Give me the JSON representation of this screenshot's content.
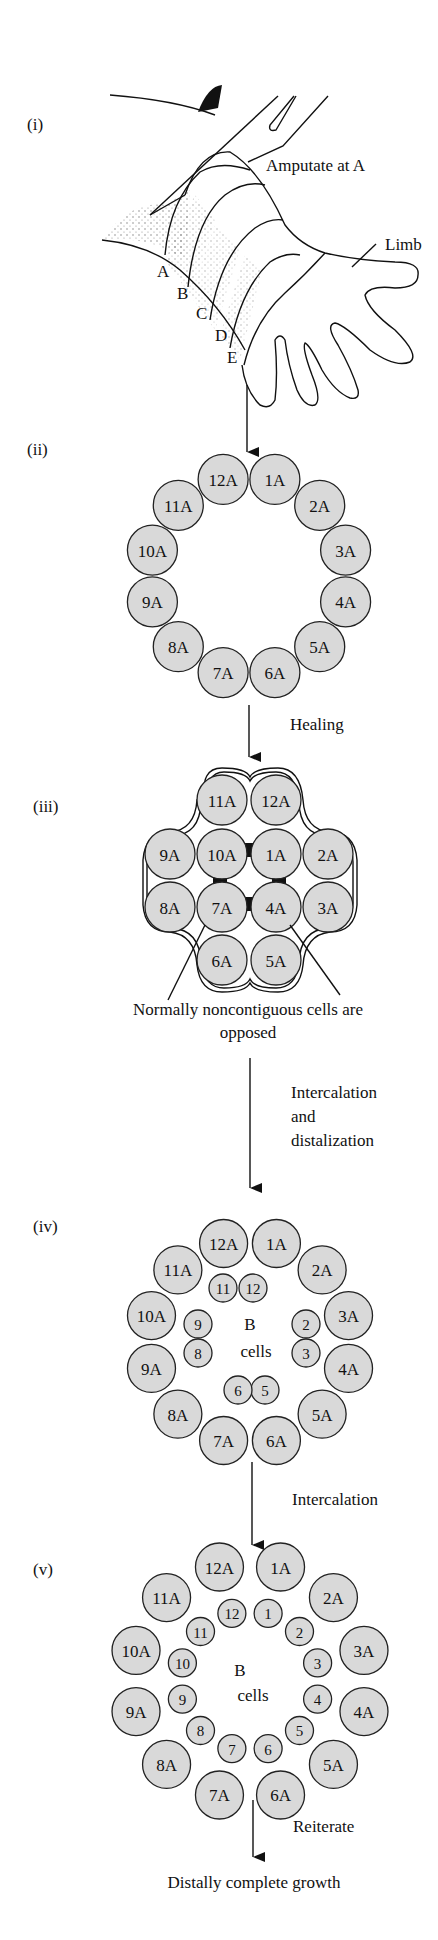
{
  "figure": {
    "stages": [
      {
        "id": "i",
        "label": "(i)"
      },
      {
        "id": "ii",
        "label": "(ii)"
      },
      {
        "id": "iii",
        "label": "(iii)"
      },
      {
        "id": "iv",
        "label": "(iv)"
      },
      {
        "id": "v",
        "label": "(v)"
      }
    ],
    "limb": {
      "amputate_label": "Amputate at A",
      "limb_label": "Limb",
      "levels": [
        "A",
        "B",
        "C",
        "D",
        "E"
      ]
    },
    "stage_ii": {
      "cells": [
        "1A",
        "2A",
        "3A",
        "4A",
        "5A",
        "6A",
        "7A",
        "8A",
        "9A",
        "10A",
        "11A",
        "12A"
      ]
    },
    "transitions": {
      "healing": "Healing",
      "intercalation_distal_1": "Intercalation",
      "intercalation_distal_2": "and",
      "intercalation_distal_3": "distalization",
      "intercalation": "Intercalation",
      "reiterate": "Reiterate"
    },
    "stage_iii": {
      "cells": [
        "11A",
        "12A",
        "9A",
        "10A",
        "1A",
        "2A",
        "8A",
        "7A",
        "4A",
        "3A",
        "6A",
        "5A"
      ],
      "note_line1": "Normally noncontiguous cells are",
      "note_line2": "opposed"
    },
    "stage_iv": {
      "outer": [
        "1A",
        "2A",
        "3A",
        "4A",
        "5A",
        "6A",
        "7A",
        "8A",
        "9A",
        "10A",
        "11A",
        "12A"
      ],
      "inner": [
        "11",
        "12",
        "2",
        "3",
        "5",
        "6",
        "8",
        "9"
      ],
      "center_line1": "B",
      "center_line2": "cells"
    },
    "stage_v": {
      "outer": [
        "1A",
        "2A",
        "3A",
        "4A",
        "5A",
        "6A",
        "7A",
        "8A",
        "9A",
        "10A",
        "11A",
        "12A"
      ],
      "inner": [
        "1",
        "2",
        "3",
        "4",
        "5",
        "6",
        "7",
        "8",
        "9",
        "10",
        "11",
        "12"
      ],
      "center_line1": "B",
      "center_line2": "cells"
    },
    "final": "Distally complete growth"
  }
}
